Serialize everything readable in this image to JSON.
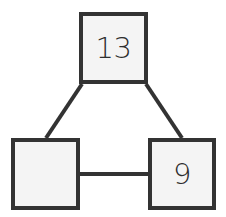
{
  "diagram": {
    "type": "number-bond",
    "whole": {
      "label": "13"
    },
    "parts": [
      {
        "label": ""
      },
      {
        "label": "9"
      }
    ],
    "colors": {
      "border": "#333333",
      "fill": "#f4f4f4",
      "text": "#2e2e2e",
      "line": "#333333"
    }
  }
}
